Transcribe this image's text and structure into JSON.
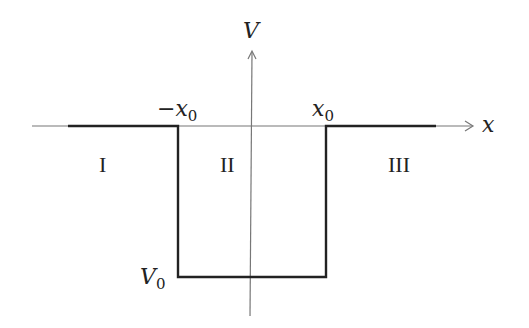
{
  "diagram": {
    "axes": {
      "x_label": "x",
      "y_label": "V"
    },
    "tick_labels": {
      "left_edge": {
        "sign": "−",
        "var": "x",
        "sub": "0"
      },
      "right_edge": {
        "var": "x",
        "sub": "0"
      },
      "depth": {
        "var": "V",
        "sub": "0"
      }
    },
    "regions": [
      {
        "label": "I"
      },
      {
        "label": "II"
      },
      {
        "label": "III"
      }
    ],
    "colors": {
      "axis": "#777777",
      "potential": "#222222",
      "text": "#222222"
    }
  }
}
